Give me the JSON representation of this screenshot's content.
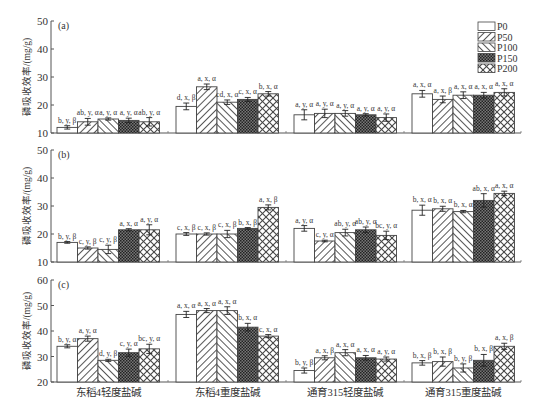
{
  "legend": {
    "items": [
      {
        "label": "P0",
        "pattern": "none"
      },
      {
        "label": "P50",
        "pattern": "diag-right"
      },
      {
        "label": "P100",
        "pattern": "diag-left"
      },
      {
        "label": "P150",
        "pattern": "dense-check"
      },
      {
        "label": "P200",
        "pattern": "crosshatch"
      }
    ]
  },
  "chart_data": [
    {
      "type": "bar",
      "panel_label": "(a)",
      "ylabel": "磷吸收效率/(mg/g)",
      "ylim": [
        10,
        50
      ],
      "yticks": [
        10,
        20,
        30,
        40,
        50
      ],
      "categories": [
        "东稻4轻度盐碱",
        "东稻4重度盐碱",
        "通育315轻度盐碱",
        "通育315重度盐碱"
      ],
      "series": [
        {
          "name": "P0",
          "values": [
            12,
            19.5,
            16.5,
            24
          ],
          "labels": [
            "b, y, β",
            "d, x, β",
            "a, y, α",
            "a, x, α"
          ]
        },
        {
          "name": "P50",
          "values": [
            14,
            26.5,
            17,
            22
          ],
          "labels": [
            "ab, y, α",
            "a, x, α",
            "a, y, α",
            "a, x, β"
          ]
        },
        {
          "name": "P100",
          "values": [
            15,
            21,
            17,
            23.5
          ],
          "labels": [
            "a, y, α",
            "cd, x, α",
            "a, y, α",
            "a, x, α"
          ]
        },
        {
          "name": "P150",
          "values": [
            14.5,
            22,
            16.5,
            23.5
          ],
          "labels": [
            "a, y, α",
            "c, x, α",
            "a, y, α",
            "a, x, α"
          ]
        },
        {
          "name": "P200",
          "values": [
            14,
            24,
            15.5,
            24.5
          ],
          "labels": [
            "ab, y, α",
            "b, x, α",
            "a, y, α",
            "a, x, α"
          ]
        }
      ],
      "errors": [
        [
          0.6,
          1.2,
          1.8,
          1.2
        ],
        [
          1.2,
          1,
          1.5,
          1.2
        ],
        [
          0.4,
          0.8,
          1,
          1.2
        ],
        [
          0.8,
          0.7,
          0.4,
          1
        ],
        [
          1.5,
          0.8,
          1.3,
          1.3
        ]
      ]
    },
    {
      "type": "bar",
      "panel_label": "(b)",
      "ylabel": "磷吸收效率/(mg/g)",
      "ylim": [
        10,
        50
      ],
      "yticks": [
        10,
        20,
        30,
        40,
        50
      ],
      "categories": [
        "东稻4轻度盐碱",
        "东稻4重度盐碱",
        "通育315轻度盐碱",
        "通育315重度盐碱"
      ],
      "series": [
        {
          "name": "P0",
          "values": [
            17,
            20,
            22,
            28.5
          ],
          "labels": [
            "b, y, β",
            "c, x, β",
            "a, y, α",
            "b, x, α"
          ]
        },
        {
          "name": "P50",
          "values": [
            15,
            20,
            17.5,
            29
          ],
          "labels": [
            "c, y, β",
            "c, x, β",
            "c, y, α",
            "b, x, α"
          ]
        },
        {
          "name": "P100",
          "values": [
            14.5,
            20,
            20.5,
            28
          ],
          "labels": [
            "c, y, β",
            "c, x, β",
            "ab, y, α",
            "b, x, α"
          ]
        },
        {
          "name": "P150",
          "values": [
            21.5,
            22,
            21.5,
            32
          ],
          "labels": [
            "a, x, α",
            "b, x, β",
            "ab, y, α",
            "ab, x, α"
          ]
        },
        {
          "name": "P200",
          "values": [
            21.5,
            29.5,
            19.5,
            34.5
          ],
          "labels": [
            "a, y, α",
            "a, x, β",
            "bc, y, α",
            "a, x, α"
          ]
        }
      ],
      "errors": [
        [
          0.3,
          0.5,
          1,
          1.8
        ],
        [
          0.4,
          0.4,
          0.3,
          0.9
        ],
        [
          1.5,
          1.3,
          1.2,
          0.4
        ],
        [
          0.4,
          0.3,
          1,
          2.4
        ],
        [
          1.8,
          0.9,
          1.5,
          0.8
        ]
      ]
    },
    {
      "type": "bar",
      "panel_label": "(c)",
      "ylabel": "磷吸收效率/(mg/g)",
      "ylim": [
        20,
        60
      ],
      "yticks": [
        20,
        30,
        40,
        50,
        60
      ],
      "categories": [
        "东稻4轻度盐碱",
        "东稻4重度盐碱",
        "通育315轻度盐碱",
        "通育315重度盐碱"
      ],
      "series": [
        {
          "name": "P0",
          "values": [
            34,
            46.5,
            24.5,
            27.5
          ],
          "labels": [
            "b, y, α",
            "a, x, α",
            "b, y, β",
            "b, x, β"
          ]
        },
        {
          "name": "P50",
          "values": [
            37,
            48,
            29.5,
            28
          ],
          "labels": [
            "a, y, α",
            "a, x, α",
            "a, x, β",
            "b, x, β"
          ]
        },
        {
          "name": "P100",
          "values": [
            28.5,
            48,
            31.5,
            25.5
          ],
          "labels": [
            "d, y, β",
            "a, x, α",
            "a, x, α",
            "b, y, β"
          ]
        },
        {
          "name": "P150",
          "values": [
            31.5,
            41.5,
            29.5,
            28.5
          ],
          "labels": [
            "c, y, α",
            "b, x, α",
            "a, x, α",
            "b, x, β"
          ]
        },
        {
          "name": "P200",
          "values": [
            33,
            38,
            29,
            34
          ],
          "labels": [
            "bc, y, α",
            "c, x, α",
            "a, y, α",
            "a, x, β"
          ]
        }
      ],
      "errors": [
        [
          0.6,
          1.2,
          1,
          0.9
        ],
        [
          1,
          0.8,
          0.8,
          1.8
        ],
        [
          0.4,
          1.5,
          1.2,
          1.6
        ],
        [
          1.4,
          1.5,
          0.9,
          2.3
        ],
        [
          1.8,
          0.6,
          0.8,
          1.2
        ]
      ]
    }
  ]
}
